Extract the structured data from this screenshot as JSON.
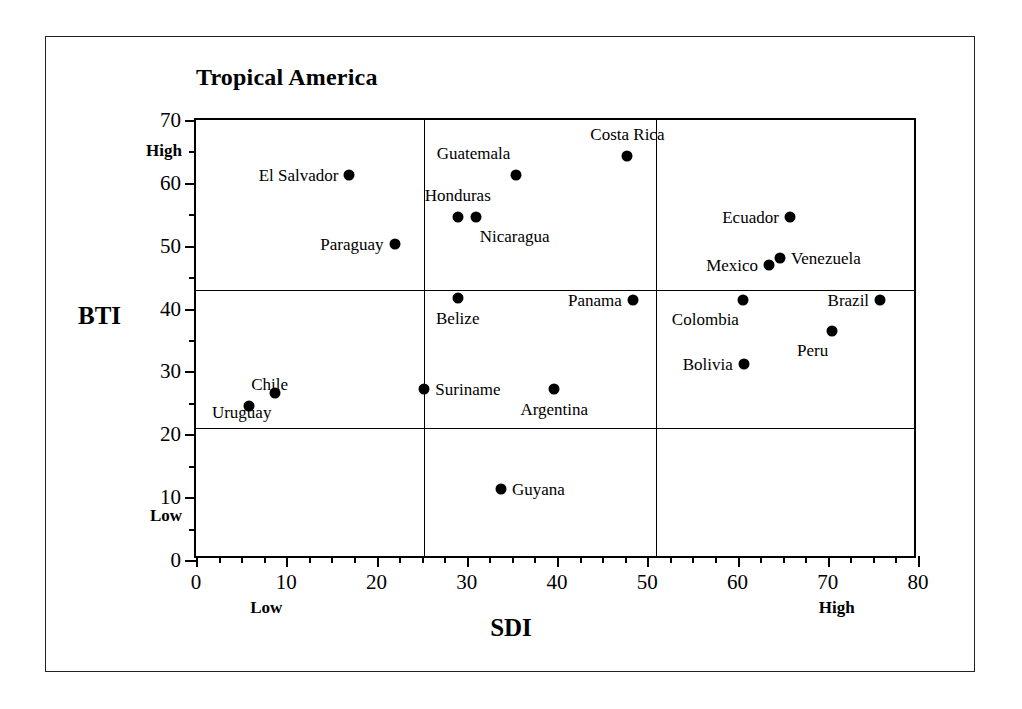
{
  "chart_data": {
    "type": "scatter",
    "title": "Tropical America",
    "xlabel": "SDI",
    "ylabel": "BTI",
    "xlim": [
      0,
      80
    ],
    "ylim": [
      0,
      70
    ],
    "xticks": [
      0,
      10,
      20,
      30,
      40,
      50,
      60,
      70,
      80
    ],
    "yticks": [
      0,
      10,
      20,
      30,
      40,
      50,
      60,
      70
    ],
    "x_minor_step": 2.5,
    "y_minor_step": 5,
    "grid": false,
    "legend": "none",
    "axis_endcaps": {
      "x_low": "Low",
      "x_high": "High",
      "y_low": "Low",
      "y_high": "High"
    },
    "quadrant_dividers": {
      "vertical_x": [
        25.3,
        51.0
      ],
      "horizontal_y": [
        21.0,
        43.0
      ]
    },
    "points": [
      {
        "name": "El Salvador",
        "x": 17.0,
        "y": 61.3,
        "label_pos": "left"
      },
      {
        "name": "Paraguay",
        "x": 22.0,
        "y": 50.3,
        "label_pos": "left"
      },
      {
        "name": "Guatemala",
        "x": 35.5,
        "y": 61.3,
        "label_pos": "upper-left"
      },
      {
        "name": "Costa Rica",
        "x": 47.8,
        "y": 64.2,
        "label_pos": "above"
      },
      {
        "name": "Honduras",
        "x": 29.0,
        "y": 54.5,
        "label_pos": "above"
      },
      {
        "name": "Nicaragua",
        "x": 31.0,
        "y": 54.5,
        "label_pos": "below-right"
      },
      {
        "name": "Ecuador",
        "x": 65.8,
        "y": 54.5,
        "label_pos": "left"
      },
      {
        "name": "Mexico",
        "x": 63.5,
        "y": 47.0,
        "label_pos": "left"
      },
      {
        "name": "Venezuela",
        "x": 64.7,
        "y": 48.1,
        "label_pos": "right"
      },
      {
        "name": "Belize",
        "x": 29.0,
        "y": 41.7,
        "label_pos": "below"
      },
      {
        "name": "Panama",
        "x": 48.4,
        "y": 41.3,
        "label_pos": "left"
      },
      {
        "name": "Colombia",
        "x": 60.6,
        "y": 41.3,
        "label_pos": "below-left"
      },
      {
        "name": "Brazil",
        "x": 75.8,
        "y": 41.3,
        "label_pos": "left"
      },
      {
        "name": "Peru",
        "x": 70.5,
        "y": 36.4,
        "label_pos": "below-left"
      },
      {
        "name": "Bolivia",
        "x": 60.7,
        "y": 31.2,
        "label_pos": "left"
      },
      {
        "name": "Chile",
        "x": 5.9,
        "y": 24.5,
        "label_pos": "upper-right"
      },
      {
        "name": "Uruguay",
        "x": 8.8,
        "y": 26.6,
        "label_pos": "below-left"
      },
      {
        "name": "Suriname",
        "x": 25.3,
        "y": 27.2,
        "label_pos": "right"
      },
      {
        "name": "Argentina",
        "x": 39.7,
        "y": 27.2,
        "label_pos": "below"
      },
      {
        "name": "Guyana",
        "x": 33.8,
        "y": 11.3,
        "label_pos": "right"
      }
    ]
  }
}
